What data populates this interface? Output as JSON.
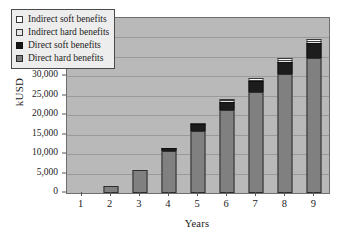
{
  "chart_data": {
    "type": "bar",
    "subtype": "stacked-column",
    "title": "",
    "xlabel": "Years",
    "ylabel": "kUSD",
    "categories": [
      "1",
      "2",
      "3",
      "4",
      "5",
      "6",
      "7",
      "8",
      "9"
    ],
    "ylim": [
      0,
      45000
    ],
    "ytick_values": [
      0,
      5000,
      10000,
      15000,
      20000,
      25000,
      30000,
      35000,
      40000,
      45000
    ],
    "ytick_labels": [
      "0",
      "5,000",
      "10,000",
      "15,000",
      "20,000",
      "25,000",
      "30,000",
      "35,000",
      "40,000",
      "45,000"
    ],
    "grid": true,
    "grid_axis": "y",
    "legend_position": "upper-left-inside",
    "series": [
      {
        "name": "Direct hard benefits",
        "key": "dh",
        "color": "#808080",
        "values": [
          0,
          1700,
          5800,
          10700,
          16000,
          21300,
          25900,
          30600,
          34700
        ]
      },
      {
        "name": "Direct soft benefits",
        "key": "ds",
        "color": "#1c1c1c",
        "values": [
          0,
          0,
          0,
          800,
          1700,
          2200,
          2800,
          3100,
          3900
        ]
      },
      {
        "name": "Indirect hard benefits",
        "key": "ih",
        "color": "#e8e8e8",
        "values": [
          0,
          0,
          0,
          0,
          100,
          200,
          400,
          600,
          600
        ]
      },
      {
        "name": "Indirect soft benefits",
        "key": "is",
        "color": "#fbfbfb",
        "values": [
          0,
          0,
          0,
          0,
          0,
          100,
          200,
          400,
          400
        ]
      }
    ],
    "totals": [
      0,
      1700,
      5800,
      11500,
      17800,
      23800,
      29300,
      34700,
      39600
    ]
  },
  "legend": {
    "entries": [
      {
        "label": "Indirect soft benefits",
        "swatch": "is"
      },
      {
        "label": "Indirect hard benefits",
        "swatch": "ih"
      },
      {
        "label": "Direct soft benefits",
        "swatch": "ds"
      },
      {
        "label": "Direct hard benefits",
        "swatch": "dh"
      }
    ]
  }
}
